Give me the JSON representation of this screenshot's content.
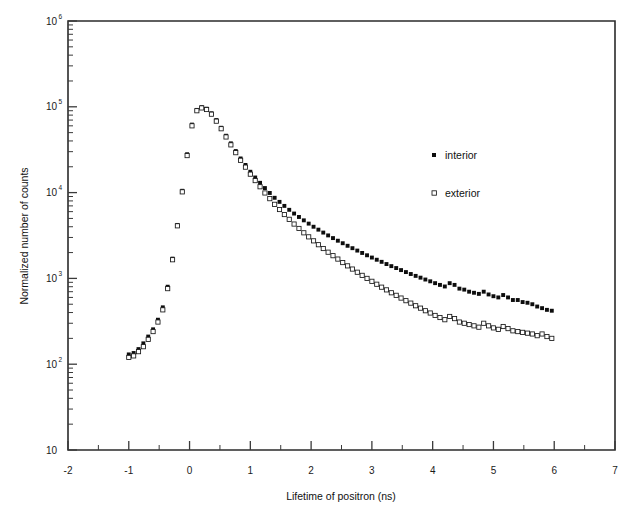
{
  "chart_data": {
    "type": "scatter",
    "title": "",
    "xlabel": "Lifetime of positron (ns)",
    "ylabel": "Normalized number of counts",
    "xlim": [
      -2,
      7
    ],
    "ylim": [
      10,
      1000000
    ],
    "yscale": "log",
    "xscale": "linear",
    "grid": false,
    "legend_position": "upper-right-inside",
    "x_ticks": [
      -2,
      -1,
      0,
      1,
      2,
      3,
      4,
      5,
      6,
      7
    ],
    "x_tick_labels": [
      "-2",
      "-1",
      "0",
      "1",
      "2",
      "3",
      "4",
      "5",
      "6",
      "7"
    ],
    "x_minor_ticks": [
      -1.5,
      -0.5,
      0.5,
      1.5,
      2.5,
      3.5,
      4.5,
      5.5,
      6.5
    ],
    "y_ticks": [
      10,
      100,
      1000,
      10000,
      100000,
      1000000
    ],
    "y_tick_labels": [
      "10",
      "10",
      "10",
      "10",
      "10",
      "10"
    ],
    "y_tick_exponents": [
      "",
      "2",
      "3",
      "4",
      "5",
      "6"
    ],
    "series": [
      {
        "name": "interior",
        "marker": "filled-square",
        "color": "#0d0d0d",
        "points": [
          [
            -1.0,
            130
          ],
          [
            -0.92,
            135
          ],
          [
            -0.84,
            150
          ],
          [
            -0.76,
            175
          ],
          [
            -0.68,
            210
          ],
          [
            -0.6,
            255
          ],
          [
            -0.52,
            330
          ],
          [
            -0.44,
            460
          ],
          [
            -0.36,
            800
          ],
          [
            -0.28,
            1700
          ],
          [
            -0.2,
            4200
          ],
          [
            -0.12,
            10500
          ],
          [
            -0.04,
            28000
          ],
          [
            0.04,
            62000
          ],
          [
            0.12,
            92000
          ],
          [
            0.2,
            99000
          ],
          [
            0.28,
            95000
          ],
          [
            0.36,
            84000
          ],
          [
            0.44,
            70000
          ],
          [
            0.52,
            57000
          ],
          [
            0.6,
            46000
          ],
          [
            0.68,
            37500
          ],
          [
            0.76,
            30500
          ],
          [
            0.84,
            25000
          ],
          [
            0.92,
            21000
          ],
          [
            1.0,
            17500
          ],
          [
            1.08,
            15000
          ],
          [
            1.16,
            13000
          ],
          [
            1.24,
            11300
          ],
          [
            1.32,
            9900
          ],
          [
            1.4,
            8700
          ],
          [
            1.48,
            7800
          ],
          [
            1.56,
            7000
          ],
          [
            1.64,
            6300
          ],
          [
            1.72,
            5700
          ],
          [
            1.8,
            5200
          ],
          [
            1.88,
            4750
          ],
          [
            1.96,
            4350
          ],
          [
            2.04,
            4000
          ],
          [
            2.12,
            3700
          ],
          [
            2.2,
            3420
          ],
          [
            2.28,
            3170
          ],
          [
            2.36,
            2950
          ],
          [
            2.44,
            2750
          ],
          [
            2.52,
            2570
          ],
          [
            2.6,
            2400
          ],
          [
            2.68,
            2250
          ],
          [
            2.76,
            2110
          ],
          [
            2.84,
            1980
          ],
          [
            2.92,
            1860
          ],
          [
            3.0,
            1750
          ],
          [
            3.08,
            1650
          ],
          [
            3.16,
            1560
          ],
          [
            3.24,
            1470
          ],
          [
            3.32,
            1390
          ],
          [
            3.4,
            1320
          ],
          [
            3.48,
            1250
          ],
          [
            3.56,
            1185
          ],
          [
            3.64,
            1125
          ],
          [
            3.72,
            1070
          ],
          [
            3.8,
            1020
          ],
          [
            3.88,
            970
          ],
          [
            3.96,
            925
          ],
          [
            4.04,
            880
          ],
          [
            4.12,
            840
          ],
          [
            4.2,
            805
          ],
          [
            4.28,
            880
          ],
          [
            4.36,
            840
          ],
          [
            4.44,
            760
          ],
          [
            4.52,
            740
          ],
          [
            4.6,
            700
          ],
          [
            4.68,
            680
          ],
          [
            4.76,
            660
          ],
          [
            4.84,
            700
          ],
          [
            4.92,
            650
          ],
          [
            5.0,
            620
          ],
          [
            5.08,
            600
          ],
          [
            5.16,
            640
          ],
          [
            5.24,
            600
          ],
          [
            5.32,
            560
          ],
          [
            5.4,
            560
          ],
          [
            5.48,
            530
          ],
          [
            5.56,
            520
          ],
          [
            5.64,
            500
          ],
          [
            5.72,
            470
          ],
          [
            5.8,
            450
          ],
          [
            5.88,
            430
          ],
          [
            5.96,
            420
          ]
        ]
      },
      {
        "name": "exterior",
        "marker": "open-square",
        "color": "#ffffff",
        "points": [
          [
            -1.0,
            120
          ],
          [
            -0.92,
            125
          ],
          [
            -0.84,
            140
          ],
          [
            -0.76,
            160
          ],
          [
            -0.68,
            195
          ],
          [
            -0.6,
            240
          ],
          [
            -0.52,
            310
          ],
          [
            -0.44,
            430
          ],
          [
            -0.36,
            760
          ],
          [
            -0.28,
            1650
          ],
          [
            -0.2,
            4100
          ],
          [
            -0.12,
            10200
          ],
          [
            -0.04,
            27000
          ],
          [
            0.04,
            60000
          ],
          [
            0.12,
            90000
          ],
          [
            0.2,
            97000
          ],
          [
            0.28,
            93000
          ],
          [
            0.36,
            82000
          ],
          [
            0.44,
            68000
          ],
          [
            0.52,
            55500
          ],
          [
            0.6,
            44500
          ],
          [
            0.68,
            36000
          ],
          [
            0.76,
            29200
          ],
          [
            0.84,
            23800
          ],
          [
            0.92,
            19800
          ],
          [
            1.0,
            16400
          ],
          [
            1.08,
            13800
          ],
          [
            1.16,
            11700
          ],
          [
            1.24,
            9900
          ],
          [
            1.32,
            8500
          ],
          [
            1.4,
            7300
          ],
          [
            1.48,
            6350
          ],
          [
            1.56,
            5550
          ],
          [
            1.64,
            4880
          ],
          [
            1.72,
            4300
          ],
          [
            1.8,
            3820
          ],
          [
            1.88,
            3400
          ],
          [
            1.96,
            3050
          ],
          [
            2.04,
            2740
          ],
          [
            2.12,
            2470
          ],
          [
            2.2,
            2230
          ],
          [
            2.28,
            2020
          ],
          [
            2.36,
            1840
          ],
          [
            2.44,
            1680
          ],
          [
            2.52,
            1530
          ],
          [
            2.6,
            1400
          ],
          [
            2.68,
            1285
          ],
          [
            2.76,
            1180
          ],
          [
            2.84,
            1085
          ],
          [
            2.92,
            1000
          ],
          [
            3.0,
            925
          ],
          [
            3.08,
            855
          ],
          [
            3.16,
            790
          ],
          [
            3.24,
            735
          ],
          [
            3.32,
            680
          ],
          [
            3.4,
            635
          ],
          [
            3.48,
            590
          ],
          [
            3.56,
            550
          ],
          [
            3.64,
            515
          ],
          [
            3.72,
            480
          ],
          [
            3.8,
            450
          ],
          [
            3.88,
            420
          ],
          [
            3.96,
            395
          ],
          [
            4.04,
            370
          ],
          [
            4.12,
            350
          ],
          [
            4.2,
            330
          ],
          [
            4.28,
            360
          ],
          [
            4.36,
            340
          ],
          [
            4.44,
            310
          ],
          [
            4.52,
            300
          ],
          [
            4.6,
            290
          ],
          [
            4.68,
            280
          ],
          [
            4.76,
            270
          ],
          [
            4.84,
            300
          ],
          [
            4.92,
            280
          ],
          [
            5.0,
            265
          ],
          [
            5.08,
            255
          ],
          [
            5.16,
            275
          ],
          [
            5.24,
            260
          ],
          [
            5.32,
            245
          ],
          [
            5.4,
            240
          ],
          [
            5.48,
            235
          ],
          [
            5.56,
            230
          ],
          [
            5.64,
            225
          ],
          [
            5.72,
            215
          ],
          [
            5.8,
            225
          ],
          [
            5.88,
            210
          ],
          [
            5.96,
            200
          ]
        ]
      }
    ],
    "legend": [
      {
        "label": "interior",
        "marker": "filled-square"
      },
      {
        "label": "exterior",
        "marker": "open-square"
      }
    ]
  }
}
